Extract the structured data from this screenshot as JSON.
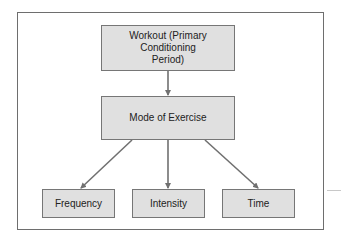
{
  "diagram": {
    "type": "flowchart",
    "nodes": [
      {
        "id": "workout",
        "label": "Workout (Primary Conditioning Period)",
        "lines": [
          "Workout (Primary",
          "Conditioning",
          "Period)"
        ]
      },
      {
        "id": "mode",
        "label": "Mode of Exercise"
      },
      {
        "id": "frequency",
        "label": "Frequency"
      },
      {
        "id": "intensity",
        "label": "Intensity"
      },
      {
        "id": "time",
        "label": "Time"
      }
    ],
    "edges": [
      {
        "from": "workout",
        "to": "mode"
      },
      {
        "from": "mode",
        "to": "frequency"
      },
      {
        "from": "mode",
        "to": "intensity"
      },
      {
        "from": "mode",
        "to": "time"
      }
    ]
  },
  "colors": {
    "node_fill": "#e0e0e0",
    "node_border": "#767676",
    "arrow": "#707070",
    "frame_border": "#6e6e6e",
    "text": "#222222"
  }
}
